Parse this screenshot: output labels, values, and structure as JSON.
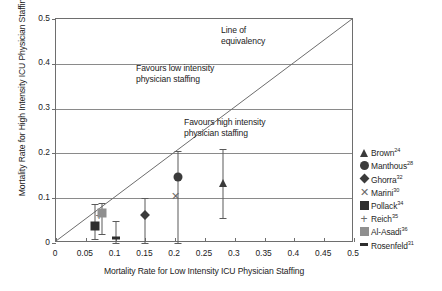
{
  "chart_data": {
    "type": "scatter",
    "title": "",
    "xlabel": "Mortality Rate for Low Intensity ICU Physician Staffing",
    "ylabel": "Mortality Rate for High Intensity ICU Physician Staffing",
    "xlim": [
      0,
      0.5
    ],
    "ylim": [
      0,
      0.5
    ],
    "xticks": [
      "0",
      "0.05",
      "0.1",
      "0.15",
      "0.2",
      "0.25",
      "0.3",
      "0.35",
      "0.4",
      "0.45",
      "0.5"
    ],
    "xtick_values": [
      0,
      0.05,
      0.1,
      0.15,
      0.2,
      0.25,
      0.3,
      0.35,
      0.4,
      0.45,
      0.5
    ],
    "yticks": [
      "0",
      "0.1",
      "0.2",
      "0.3",
      "0.4",
      "0.5"
    ],
    "ytick_values": [
      0,
      0.1,
      0.2,
      0.3,
      0.4,
      0.5
    ],
    "grid": "horizontal",
    "legend_position": "right",
    "reference_line": {
      "label": "Line of equivalency",
      "from": [
        0,
        0
      ],
      "to": [
        0.5,
        0.5
      ]
    },
    "annotations": [
      {
        "text": "Line of\nequivalency",
        "x": 0.28,
        "y": 0.475
      },
      {
        "text": "Favours low intensity\nphysician staffing",
        "x": 0.135,
        "y": 0.355
      },
      {
        "text": "Favours high intensity\nphysician staffing",
        "x": 0.215,
        "y": 0.235
      }
    ],
    "series": [
      {
        "name": "Brown",
        "ref": "24",
        "marker": "triangle",
        "x": 0.28,
        "y": 0.135,
        "ylow": 0.055,
        "yhigh": 0.21
      },
      {
        "name": "Manthous",
        "ref": "28",
        "marker": "circle",
        "x": 0.205,
        "y": 0.148,
        "ylow": 0.0,
        "yhigh": 0.205
      },
      {
        "name": "Ghorra",
        "ref": "32",
        "marker": "diamond",
        "x": 0.15,
        "y": 0.062,
        "ylow": 0.0,
        "yhigh": 0.1
      },
      {
        "name": "Marini",
        "ref": "30",
        "marker": "x",
        "x": 0.2,
        "y": 0.105,
        "ylow": null,
        "yhigh": null
      },
      {
        "name": "Pollack",
        "ref": "34",
        "marker": "square",
        "x": 0.065,
        "y": 0.037,
        "ylow": 0.008,
        "yhigh": 0.086
      },
      {
        "name": "Reich",
        "ref": "35",
        "marker": "plus",
        "x": 0.072,
        "y": 0.06,
        "ylow": null,
        "yhigh": null
      },
      {
        "name": "Al-Asadi",
        "ref": "36",
        "marker": "gray-square",
        "x": 0.078,
        "y": 0.068,
        "ylow": 0.02,
        "yhigh": 0.09
      },
      {
        "name": "Rosenfeld",
        "ref": "31",
        "marker": "dash",
        "x": 0.1,
        "y": 0.012,
        "ylow": 0.0,
        "yhigh": 0.05
      }
    ]
  },
  "legend": {
    "items": [
      {
        "label": "Brown",
        "ref": "24",
        "marker": "triangle-marker"
      },
      {
        "label": "Manthous",
        "ref": "28",
        "marker": "circle-marker"
      },
      {
        "label": "Ghorra",
        "ref": "32",
        "marker": "diamond-marker"
      },
      {
        "label": "Marini",
        "ref": "30",
        "marker": "x-marker"
      },
      {
        "label": "Pollack",
        "ref": "34",
        "marker": "square-marker"
      },
      {
        "label": "Reich",
        "ref": "35",
        "marker": "plus-marker"
      },
      {
        "label": "Al-Asadi",
        "ref": "36",
        "marker": "gray-square-marker"
      },
      {
        "label": "Rosenfeld",
        "ref": "31",
        "marker": "dash-marker"
      }
    ]
  },
  "colors": {
    "marker_dark": "#3b3b3b",
    "marker_gray": "#8f8f8f",
    "grid": "#8a8a8a",
    "axis": "#6e6e6e",
    "text": "#222222"
  }
}
